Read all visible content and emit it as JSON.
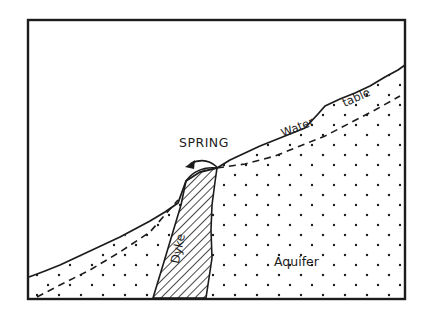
{
  "diagram": {
    "type": "geological cross-section",
    "labels": {
      "spring": "SPRING",
      "water": "Water",
      "table": "table",
      "dyke": "Dyke",
      "aquifer": "Aquifer"
    },
    "elements": [
      {
        "name": "frame",
        "description": "rectangular border"
      },
      {
        "name": "ground-surface",
        "description": "irregular line rising from lower-left to upper-right"
      },
      {
        "name": "water-table",
        "description": "dashed line below ground surface, meeting surface at spring"
      },
      {
        "name": "dyke",
        "description": "diagonal-hatched vertical intrusion"
      },
      {
        "name": "aquifer",
        "description": "dotted (stippled) permeable rock"
      },
      {
        "name": "spring-arrow",
        "description": "curved arrow showing water emerging at surface"
      }
    ],
    "colors": {
      "ink": "#1c1c1c",
      "background": "#ffffff"
    }
  }
}
